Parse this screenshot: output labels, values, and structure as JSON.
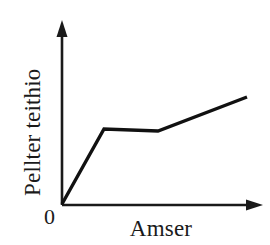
{
  "figure": {
    "background_color": "#ffffff",
    "line_color": "#111111",
    "axis_color": "#1a1a1a",
    "text_color": "#1a1a1a"
  },
  "labels": {
    "y_axis": "Pellter teithio",
    "x_axis": "Amser",
    "origin": "0"
  },
  "icons": {
    "y_axis_arrow": "arrow-up-icon",
    "x_axis_arrow": "arrow-right-icon"
  },
  "chart_data": {
    "type": "line",
    "title": "",
    "xlabel": "Amser",
    "ylabel": "Pellter teithio",
    "xlim": [
      0,
      10
    ],
    "ylim": [
      0,
      10
    ],
    "grid": false,
    "legend": "none",
    "tick_labels": {
      "x": [],
      "y": [],
      "origin": "0"
    },
    "annotations": [],
    "series": [
      {
        "name": "Pellter teithio",
        "x": [
          0,
          2.2,
          5.0,
          9.7
        ],
        "y": [
          0,
          4.1,
          4.0,
          5.85
        ],
        "pixel_points": [
          [
            62,
            204
          ],
          [
            104,
            129
          ],
          [
            158,
            131
          ],
          [
            247,
            97
          ]
        ],
        "description": "Steep rise, then flat plateau, then gentler rise"
      }
    ]
  }
}
